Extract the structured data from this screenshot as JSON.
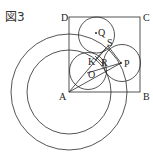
{
  "figure": {
    "title": "図3",
    "points": {
      "A": "A",
      "B": "B",
      "C": "C",
      "D": "D",
      "P": "P",
      "Q": "Q",
      "R": "R",
      "S": "S",
      "K": "K",
      "O": "O"
    },
    "colors": {
      "stroke": "#2a2a2a",
      "background": "#ffffff"
    }
  }
}
